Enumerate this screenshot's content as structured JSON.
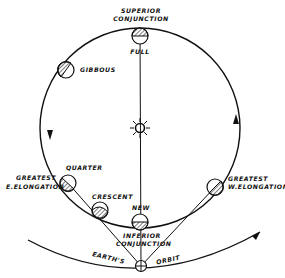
{
  "diagram": {
    "colors": {
      "ink": "#111111",
      "background": "#ffffff"
    },
    "labels": {
      "superior_conjunction_1": "SUPERIOR",
      "superior_conjunction_2": "CONJUNCTION",
      "full": "FULL",
      "gibbous": "GIBBOUS",
      "quarter": "QUARTER",
      "greatest_e_1": "GREATEST",
      "greatest_e_2": "E.ELONGATION",
      "crescent": "CRESCENT",
      "new": "NEW",
      "inferior_conjunction_1": "INFERIOR",
      "inferior_conjunction_2": "CONJUNCTION",
      "greatest_w_1": "GREATEST",
      "greatest_w_2": "W.ELONGATION",
      "earths": "EARTH'S",
      "orbit": "ORBIT"
    },
    "icons": [
      "sun-icon",
      "earth-icon",
      "planet-icon",
      "orbit-arrow-icon"
    ]
  }
}
